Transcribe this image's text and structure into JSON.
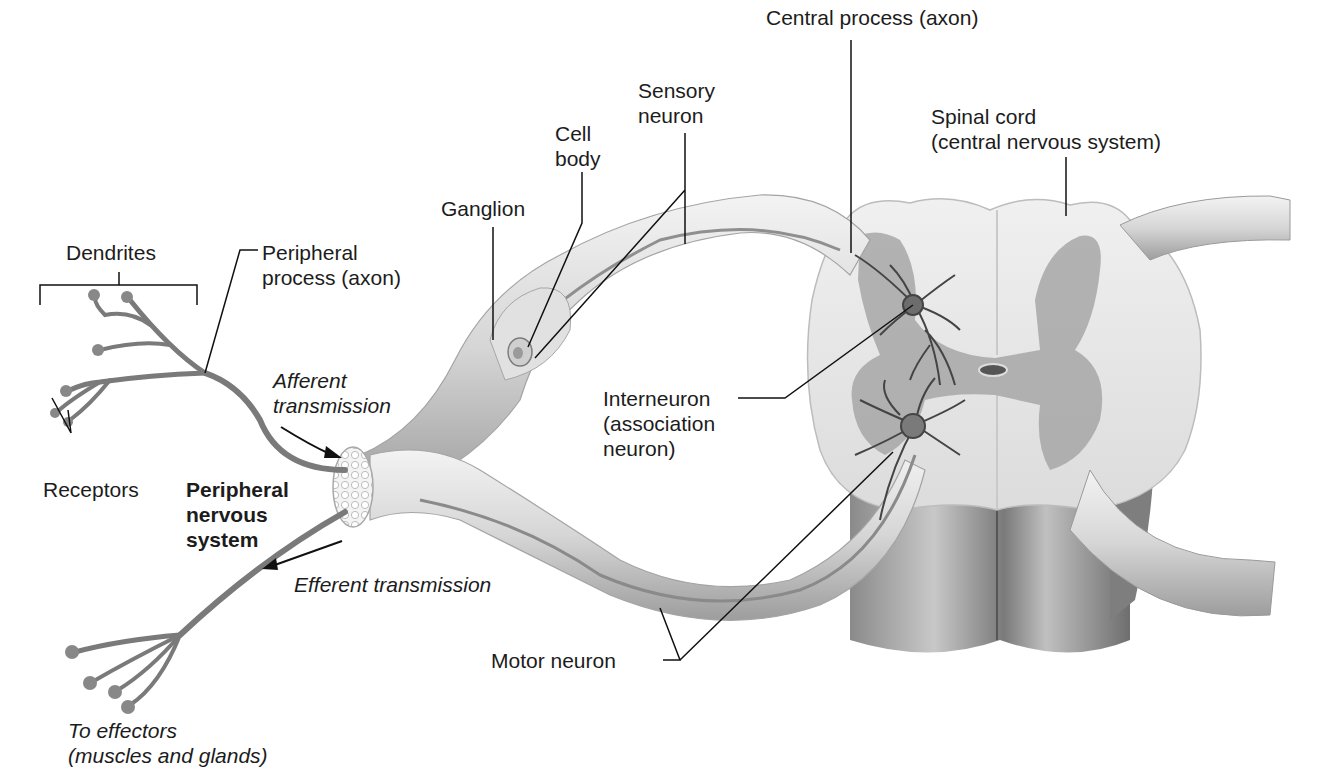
{
  "figure": {
    "colors": {
      "background": "#ffffff",
      "nerve_light": "#e6e6e6",
      "nerve_mid": "#bdbdbd",
      "nerve_dark": "#8c8c8c",
      "gray_matter": "#9a9a9a",
      "neuron": "#555555",
      "leader_line": "#111111"
    }
  },
  "labels": {
    "dendrites": "Dendrites",
    "peripheral_process": "Peripheral\nprocess (axon)",
    "receptors": "Receptors",
    "afferent": "Afferent\ntransmission",
    "pns": "Peripheral\nnervous\nsystem",
    "efferent": "Efferent transmission",
    "effectors": "To effectors\n(muscles and glands)",
    "ganglion": "Ganglion",
    "cell_body": "Cell\nbody",
    "sensory_neuron": "Sensory\nneuron",
    "central_process": "Central process (axon)",
    "spinal_cord": "Spinal cord\n(central nervous system)",
    "interneuron": "Interneuron\n(association\nneuron)",
    "motor_neuron": "Motor neuron"
  }
}
